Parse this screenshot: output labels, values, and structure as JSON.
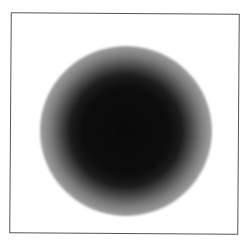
{
  "image": {
    "description": "Grayscale radial blob (dark core fading to white halo) inside a thin square frame",
    "frame_color": "#555555",
    "background_color": "#ffffff",
    "core_color": "#0a0a0a"
  }
}
